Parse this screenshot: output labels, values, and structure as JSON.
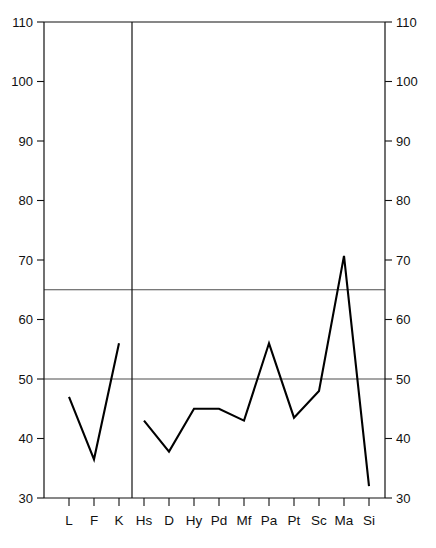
{
  "chart_data": {
    "type": "line",
    "title": "",
    "subtitle": "",
    "xlabel": "",
    "ylabel": "",
    "categories": [
      "L",
      "F",
      "K",
      "Hs",
      "D",
      "Hy",
      "Pd",
      "Mf",
      "Pa",
      "Pt",
      "Sc",
      "Ma",
      "Si"
    ],
    "values": [
      47,
      36.5,
      56,
      43,
      37.8,
      45,
      45,
      43,
      56,
      43.5,
      48,
      70.7,
      32
    ],
    "series": [
      {
        "name": "profile",
        "values": [
          47,
          36.5,
          56,
          43,
          37.8,
          45,
          45,
          43,
          56,
          43.5,
          48,
          70.7,
          32
        ]
      }
    ],
    "ylim": [
      30,
      110
    ],
    "ytick_values": [
      30,
      40,
      50,
      60,
      70,
      80,
      90,
      100,
      110
    ],
    "left_axis_ticks": [
      "30",
      "40",
      "50",
      "60",
      "70",
      "80",
      "90",
      "100",
      "110"
    ],
    "right_axis_ticks": [
      "30",
      "40",
      "50",
      "60",
      "70",
      "80",
      "90",
      "100",
      "110"
    ],
    "gridlines": [
      50,
      65
    ],
    "grid": true,
    "legend": null,
    "legend_position": "none",
    "group_divider_after_category": "K",
    "line_color": "#000000",
    "grid_color": "#4d4d4d",
    "frame_color": "#111111",
    "background_color": "#ffffff"
  }
}
